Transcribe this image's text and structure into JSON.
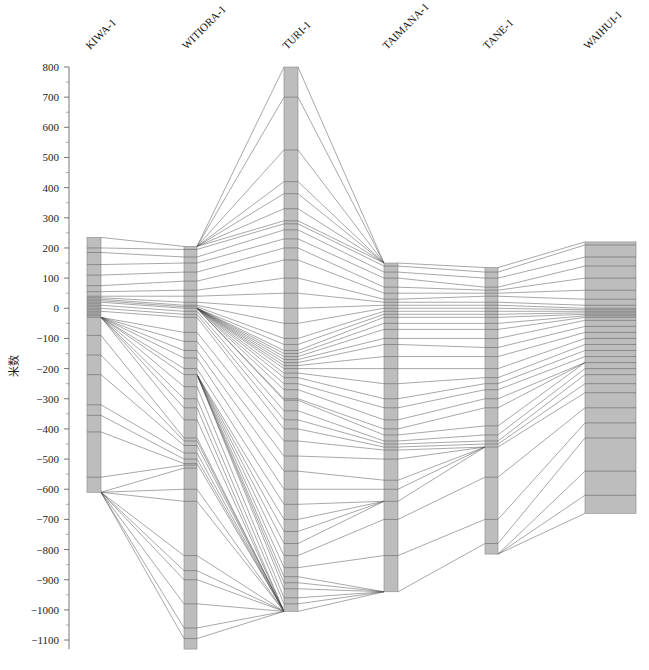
{
  "chart_data": {
    "type": "parallel-correlation",
    "title": "",
    "ylabel": "米数",
    "ylim": [
      -1130,
      800
    ],
    "yticks": [
      800,
      700,
      600,
      500,
      400,
      300,
      200,
      100,
      0,
      -100,
      -200,
      -300,
      -400,
      -500,
      -600,
      -700,
      -800,
      -900,
      -1000,
      -1100
    ],
    "columns": [
      {
        "name": "KIWA-1",
        "top": 235,
        "bottom": -610,
        "x": 87,
        "width": 14,
        "horizons": [
          200,
          185,
          145,
          110,
          75,
          55,
          40,
          35,
          30,
          25,
          20,
          15,
          10,
          5,
          0,
          -5,
          -10,
          -15,
          -20,
          -25,
          -30,
          -90,
          -155,
          -220,
          -320,
          -355,
          -410,
          -560
        ]
      },
      {
        "name": "WITIORA-1",
        "top": 205,
        "bottom": -1130,
        "x": 184,
        "width": 13,
        "horizons": [
          195,
          170,
          150,
          120,
          90,
          60,
          40,
          20,
          10,
          5,
          0,
          -10,
          -20,
          -30,
          -80,
          -110,
          -140,
          -165,
          -200,
          -220,
          -260,
          -300,
          -330,
          -370,
          -430,
          -440,
          -455,
          -480,
          -500,
          -515,
          -520,
          -530,
          -600,
          -640,
          -820,
          -870,
          -900,
          -980,
          -1060,
          -1095
        ]
      },
      {
        "name": "TURI-1",
        "top": 800,
        "bottom": -1005,
        "x": 284,
        "width": 14,
        "horizons": [
          700,
          525,
          420,
          380,
          330,
          290,
          280,
          260,
          230,
          200,
          160,
          100,
          50,
          0,
          -50,
          -100,
          -120,
          -140,
          -150,
          -160,
          -170,
          -180,
          -190,
          -200,
          -215,
          -230,
          -250,
          -270,
          -300,
          -305,
          -340,
          -370,
          -400,
          -440,
          -490,
          -540,
          -600,
          -650,
          -700,
          -740,
          -780,
          -820,
          -860,
          -890,
          -910,
          -930,
          -960,
          -980
        ]
      },
      {
        "name": "TAIMANA-1",
        "top": 150,
        "bottom": -940,
        "x": 384,
        "width": 14,
        "horizons": [
          140,
          120,
          100,
          70,
          50,
          30,
          20,
          10,
          0,
          -10,
          -20,
          -30,
          -50,
          -70,
          -100,
          -120,
          -160,
          -200,
          -250,
          -300,
          -330,
          -370,
          -400,
          -420,
          -440,
          -450,
          -460,
          -470,
          -500,
          -570,
          -600,
          -640,
          -700,
          -820
        ]
      },
      {
        "name": "TANE-1",
        "top": 135,
        "bottom": -815,
        "x": 485,
        "width": 13,
        "horizons": [
          120,
          100,
          70,
          60,
          50,
          40,
          20,
          10,
          0,
          -10,
          -20,
          -30,
          -50,
          -70,
          -100,
          -130,
          -160,
          -200,
          -230,
          -250,
          -270,
          -300,
          -330,
          -390,
          -420,
          -440,
          -450,
          -460,
          -560,
          -700,
          -780
        ]
      },
      {
        "name": "WAIHUI-1",
        "top": 220,
        "bottom": -680,
        "x": 585,
        "width": 51,
        "horizons": [
          210,
          170,
          140,
          100,
          60,
          30,
          10,
          0,
          -5,
          -10,
          -15,
          -20,
          -25,
          -30,
          -40,
          -60,
          -80,
          -100,
          -120,
          -140,
          -160,
          -180,
          -200,
          -220,
          -250,
          -280,
          -330,
          -380,
          -430,
          -540,
          -620
        ]
      }
    ],
    "connections": [
      {
        "from": 0,
        "to": 1,
        "pairs": [
          [
            235,
            205
          ],
          [
            200,
            195
          ],
          [
            185,
            170
          ],
          [
            145,
            150
          ],
          [
            110,
            120
          ],
          [
            75,
            90
          ],
          [
            55,
            60
          ],
          [
            40,
            40
          ],
          [
            35,
            20
          ],
          [
            30,
            10
          ],
          [
            25,
            5
          ],
          [
            20,
            0
          ],
          [
            10,
            -10
          ],
          [
            0,
            -20
          ],
          [
            -10,
            -30
          ],
          [
            -30,
            -80
          ],
          [
            -30,
            -110
          ],
          [
            -30,
            -140
          ],
          [
            -30,
            -165
          ],
          [
            -30,
            -200
          ],
          [
            -30,
            -220
          ],
          [
            -30,
            -260
          ],
          [
            -30,
            -300
          ],
          [
            -30,
            -330
          ],
          [
            -30,
            -370
          ],
          [
            -90,
            -430
          ],
          [
            -155,
            -440
          ],
          [
            -220,
            -455
          ],
          [
            -320,
            -480
          ],
          [
            -355,
            -500
          ],
          [
            -410,
            -515
          ],
          [
            -560,
            -520
          ],
          [
            -610,
            -530
          ],
          [
            -610,
            -600
          ],
          [
            -610,
            -640
          ],
          [
            -610,
            -820
          ],
          [
            -610,
            -870
          ],
          [
            -610,
            -900
          ],
          [
            -610,
            -980
          ],
          [
            -610,
            -1060
          ],
          [
            -610,
            -1095
          ]
        ]
      },
      {
        "from": 1,
        "to": 2,
        "pairs": [
          [
            205,
            800
          ],
          [
            205,
            700
          ],
          [
            205,
            525
          ],
          [
            205,
            420
          ],
          [
            205,
            380
          ],
          [
            205,
            330
          ],
          [
            205,
            290
          ],
          [
            195,
            280
          ],
          [
            170,
            260
          ],
          [
            150,
            230
          ],
          [
            120,
            200
          ],
          [
            90,
            160
          ],
          [
            60,
            100
          ],
          [
            40,
            50
          ],
          [
            20,
            0
          ],
          [
            10,
            -50
          ],
          [
            5,
            -100
          ],
          [
            0,
            -120
          ],
          [
            0,
            -140
          ],
          [
            0,
            -150
          ],
          [
            0,
            -160
          ],
          [
            0,
            -170
          ],
          [
            0,
            -180
          ],
          [
            0,
            -190
          ],
          [
            0,
            -200
          ],
          [
            0,
            -215
          ],
          [
            0,
            -230
          ],
          [
            0,
            -250
          ],
          [
            0,
            -270
          ],
          [
            0,
            -300
          ],
          [
            0,
            -305
          ],
          [
            -10,
            -340
          ],
          [
            -20,
            -370
          ],
          [
            -30,
            -400
          ],
          [
            -80,
            -440
          ],
          [
            -110,
            -490
          ],
          [
            -140,
            -540
          ],
          [
            -165,
            -600
          ],
          [
            -200,
            -650
          ],
          [
            -220,
            -700
          ],
          [
            -220,
            -740
          ],
          [
            -220,
            -780
          ],
          [
            -220,
            -820
          ],
          [
            -220,
            -860
          ],
          [
            -220,
            -890
          ],
          [
            -220,
            -910
          ],
          [
            -220,
            -930
          ],
          [
            -260,
            -960
          ],
          [
            -300,
            -980
          ],
          [
            -330,
            -1005
          ],
          [
            -370,
            -1005
          ],
          [
            -430,
            -1005
          ],
          [
            -440,
            -1005
          ],
          [
            -455,
            -1005
          ],
          [
            -480,
            -1005
          ],
          [
            -500,
            -1005
          ],
          [
            -515,
            -1005
          ],
          [
            -600,
            -1005
          ],
          [
            -640,
            -1005
          ],
          [
            -820,
            -1005
          ],
          [
            -870,
            -1005
          ],
          [
            -900,
            -1005
          ],
          [
            -980,
            -1005
          ],
          [
            -1060,
            -1005
          ],
          [
            -1095,
            -1005
          ]
        ]
      },
      {
        "from": 2,
        "to": 3,
        "pairs": [
          [
            800,
            150
          ],
          [
            700,
            150
          ],
          [
            525,
            150
          ],
          [
            420,
            150
          ],
          [
            380,
            150
          ],
          [
            330,
            150
          ],
          [
            290,
            150
          ],
          [
            280,
            140
          ],
          [
            260,
            120
          ],
          [
            230,
            100
          ],
          [
            200,
            70
          ],
          [
            160,
            50
          ],
          [
            100,
            30
          ],
          [
            50,
            20
          ],
          [
            0,
            10
          ],
          [
            -50,
            0
          ],
          [
            -100,
            -10
          ],
          [
            -120,
            -20
          ],
          [
            -140,
            -30
          ],
          [
            -150,
            -50
          ],
          [
            -160,
            -70
          ],
          [
            -170,
            -100
          ],
          [
            -180,
            -120
          ],
          [
            -190,
            -160
          ],
          [
            -200,
            -200
          ],
          [
            -215,
            -250
          ],
          [
            -230,
            -300
          ],
          [
            -250,
            -330
          ],
          [
            -270,
            -370
          ],
          [
            -300,
            -400
          ],
          [
            -305,
            -420
          ],
          [
            -340,
            -440
          ],
          [
            -370,
            -450
          ],
          [
            -400,
            -460
          ],
          [
            -440,
            -470
          ],
          [
            -490,
            -500
          ],
          [
            -540,
            -570
          ],
          [
            -600,
            -600
          ],
          [
            -650,
            -640
          ],
          [
            -700,
            -640
          ],
          [
            -740,
            -640
          ],
          [
            -780,
            -640
          ],
          [
            -820,
            -700
          ],
          [
            -860,
            -820
          ],
          [
            -890,
            -940
          ],
          [
            -910,
            -940
          ],
          [
            -930,
            -940
          ],
          [
            -960,
            -940
          ],
          [
            -980,
            -940
          ],
          [
            -1005,
            -940
          ]
        ]
      },
      {
        "from": 3,
        "to": 4,
        "pairs": [
          [
            150,
            135
          ],
          [
            140,
            120
          ],
          [
            120,
            100
          ],
          [
            100,
            70
          ],
          [
            70,
            60
          ],
          [
            50,
            50
          ],
          [
            30,
            40
          ],
          [
            20,
            20
          ],
          [
            10,
            10
          ],
          [
            0,
            0
          ],
          [
            -10,
            -10
          ],
          [
            -20,
            -20
          ],
          [
            -30,
            -30
          ],
          [
            -50,
            -50
          ],
          [
            -70,
            -70
          ],
          [
            -100,
            -100
          ],
          [
            -120,
            -130
          ],
          [
            -160,
            -160
          ],
          [
            -200,
            -200
          ],
          [
            -250,
            -230
          ],
          [
            -300,
            -250
          ],
          [
            -330,
            -270
          ],
          [
            -370,
            -300
          ],
          [
            -400,
            -330
          ],
          [
            -420,
            -390
          ],
          [
            -440,
            -420
          ],
          [
            -450,
            -440
          ],
          [
            -460,
            -450
          ],
          [
            -470,
            -460
          ],
          [
            -500,
            -460
          ],
          [
            -570,
            -460
          ],
          [
            -600,
            -460
          ],
          [
            -640,
            -460
          ],
          [
            -700,
            -560
          ],
          [
            -820,
            -700
          ],
          [
            -940,
            -780
          ]
        ]
      },
      {
        "from": 4,
        "to": 5,
        "pairs": [
          [
            135,
            220
          ],
          [
            120,
            210
          ],
          [
            100,
            170
          ],
          [
            70,
            140
          ],
          [
            60,
            100
          ],
          [
            50,
            60
          ],
          [
            40,
            30
          ],
          [
            20,
            10
          ],
          [
            10,
            0
          ],
          [
            0,
            -5
          ],
          [
            -10,
            -10
          ],
          [
            -20,
            -15
          ],
          [
            -30,
            -20
          ],
          [
            -50,
            -25
          ],
          [
            -70,
            -30
          ],
          [
            -100,
            -40
          ],
          [
            -130,
            -60
          ],
          [
            -160,
            -80
          ],
          [
            -200,
            -100
          ],
          [
            -230,
            -120
          ],
          [
            -250,
            -140
          ],
          [
            -270,
            -160
          ],
          [
            -300,
            -180
          ],
          [
            -330,
            -180
          ],
          [
            -390,
            -180
          ],
          [
            -420,
            -200
          ],
          [
            -440,
            -220
          ],
          [
            -450,
            -250
          ],
          [
            -460,
            -280
          ],
          [
            -560,
            -330
          ],
          [
            -700,
            -380
          ],
          [
            -780,
            -430
          ],
          [
            -815,
            -540
          ],
          [
            -815,
            -620
          ],
          [
            -815,
            -680
          ]
        ]
      }
    ]
  },
  "axis": {
    "ylabel": "米数"
  },
  "columns": {
    "labels": [
      "KIWA-1",
      "WITIORA-1",
      "TURI-1",
      "TAIMANA-1",
      "TANE-1",
      "WAIHUI-1"
    ]
  }
}
